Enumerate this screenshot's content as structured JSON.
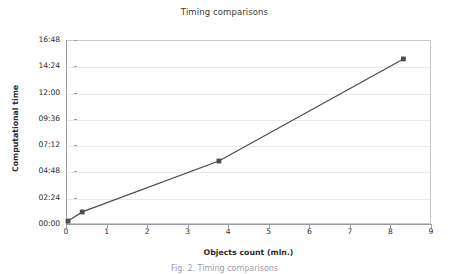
{
  "figure": {
    "caption": "Fig. 2. Timing comparisons"
  },
  "chart_data": {
    "type": "line",
    "title": "Timing comparisons",
    "xlabel": "Objects count (mln.)",
    "ylabel": "Computational time",
    "grid": true,
    "legend": "none",
    "xlim": [
      0,
      9
    ],
    "ylim_minutes": [
      0,
      16.8
    ],
    "xticks": [
      "0",
      "1",
      "2",
      "3",
      "4",
      "5",
      "6",
      "7",
      "8",
      "9"
    ],
    "xtick_values": [
      0,
      1,
      2,
      3,
      4,
      5,
      6,
      7,
      8,
      9
    ],
    "yticks": [
      "00:00",
      "02:24",
      "04:48",
      "07:12",
      "09:36",
      "12:00",
      "14:24",
      "16:48"
    ],
    "ytick_minutes": [
      0,
      2.4,
      4.8,
      7.2,
      9.6,
      12.0,
      14.4,
      16.8
    ],
    "series": [
      {
        "name": "Computational time",
        "color": "#4d4d4d",
        "marker": "square",
        "x": [
          0.05,
          0.4,
          3.77,
          8.32
        ],
        "y_minutes": [
          0.27,
          1.1,
          5.75,
          15.07
        ],
        "y_labels": [
          "00:16",
          "01:06",
          "05:45",
          "15:04"
        ]
      }
    ]
  }
}
